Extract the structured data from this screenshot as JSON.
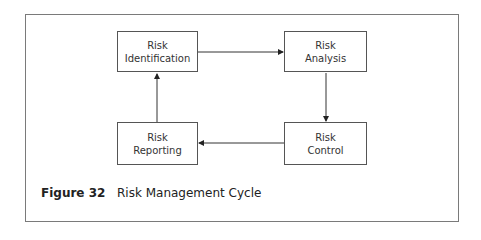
{
  "diagram": {
    "nodes": [
      {
        "id": "identification",
        "line1": "Risk",
        "line2": "Identification"
      },
      {
        "id": "analysis",
        "line1": "Risk",
        "line2": "Analysis"
      },
      {
        "id": "control",
        "line1": "Risk",
        "line2": "Control"
      },
      {
        "id": "reporting",
        "line1": "Risk",
        "line2": "Reporting"
      }
    ],
    "edges": [
      {
        "from": "identification",
        "to": "analysis"
      },
      {
        "from": "analysis",
        "to": "control"
      },
      {
        "from": "control",
        "to": "reporting"
      },
      {
        "from": "reporting",
        "to": "identification"
      }
    ]
  },
  "caption": {
    "label": "Figure 32",
    "title": "Risk Management Cycle"
  }
}
